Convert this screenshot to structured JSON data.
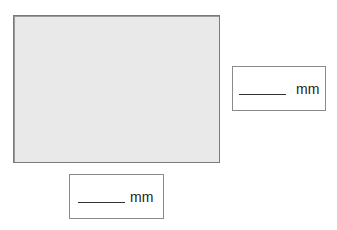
{
  "figure": {
    "shape": "rectangle",
    "fill_color": "#e9e9e9",
    "border_color": "#7a7a7a"
  },
  "answers": {
    "height": {
      "value": "",
      "unit": "mm"
    },
    "width": {
      "value": "",
      "unit": "mm"
    }
  }
}
